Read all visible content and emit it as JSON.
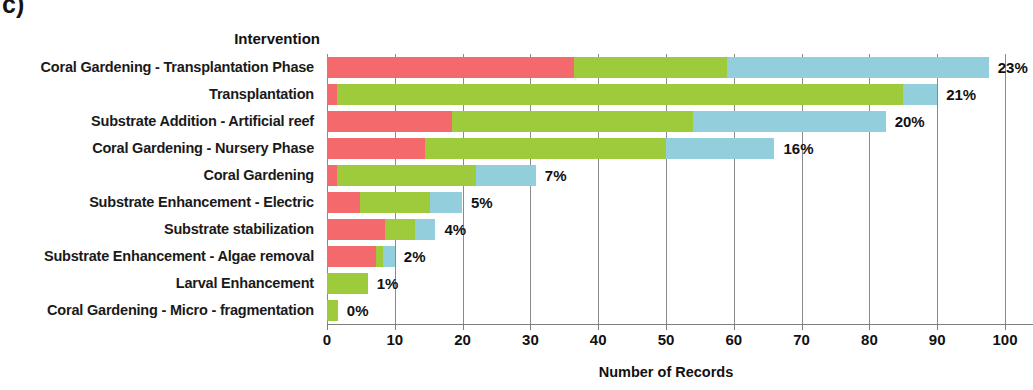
{
  "panel": {
    "tag": "c)"
  },
  "chart_data": {
    "type": "bar",
    "orientation": "horizontal",
    "stacked": true,
    "title": "",
    "legend_title": "Intervention",
    "xlabel": "Number of Records",
    "ylabel": "Intervention",
    "xlim": [
      0,
      100
    ],
    "xticks": [
      0,
      10,
      20,
      30,
      40,
      50,
      60,
      70,
      80,
      90,
      100
    ],
    "xtick_labels": [
      "0",
      "10",
      "20",
      "30",
      "40",
      "50",
      "60",
      "70",
      "80",
      "90",
      "100"
    ],
    "grid": true,
    "grid_axis": "x",
    "legend": "none",
    "colors": {
      "series_1": "#F4696C",
      "series_2": "#9DCB3B",
      "series_3": "#92CEDC"
    },
    "categories": [
      "Coral Gardening - Transplantation Phase",
      "Transplantation",
      "Substrate Addition - Artificial reef",
      "Coral Gardening - Nursery Phase",
      "Coral Gardening",
      "Substrate Enhancement - Electric",
      "Substrate stabilization",
      "Substrate Enhancement - Algae removal",
      "Larval Enhancement",
      "Coral Gardening - Micro - fragmentation"
    ],
    "series": [
      {
        "name": "series_1",
        "values": [
          36.5,
          1.5,
          18.5,
          14.5,
          1.5,
          4.8,
          8.5,
          7.2,
          0,
          0
        ]
      },
      {
        "name": "series_2",
        "values": [
          22.5,
          83.5,
          35.5,
          35.5,
          20.5,
          10.4,
          4.5,
          1.0,
          6.0,
          1.6
        ]
      },
      {
        "name": "series_3",
        "values": [
          38.6,
          5.0,
          28.4,
          16.0,
          8.8,
          4.7,
          3.0,
          1.8,
          0,
          0
        ]
      }
    ],
    "totals": [
      97.6,
      90.0,
      82.4,
      66.0,
      30.8,
      19.9,
      16.0,
      10.0,
      6.0,
      1.6
    ],
    "data_labels": [
      "23%",
      "21%",
      "20%",
      "16%",
      "7%",
      "5%",
      "4%",
      "2%",
      "1%",
      "0%"
    ]
  }
}
